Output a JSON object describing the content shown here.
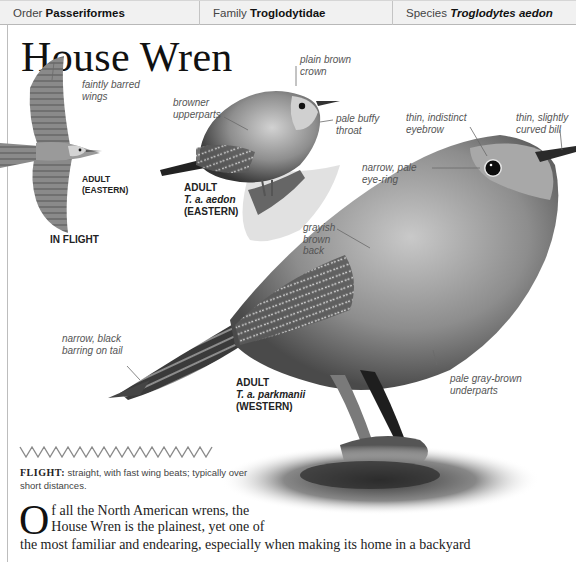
{
  "taxonomy": {
    "order_label": "Order",
    "order_value": "Passeriformes",
    "family_label": "Family",
    "family_value": "Troglodytidae",
    "species_label": "Species",
    "species_value": "Troglodytes aedon"
  },
  "title": "House Wren",
  "flight_illustration": {
    "annotation": [
      "faintly barred",
      "wings"
    ],
    "caption_line1": "ADULT",
    "caption_line2": "(EASTERN)",
    "label": "IN FLIGHT"
  },
  "eastern_bird": {
    "annotations": {
      "crown": [
        "plain brown",
        "crown"
      ],
      "upperparts": [
        "browner",
        "upperparts"
      ],
      "throat": [
        "pale buffy",
        "throat"
      ]
    },
    "caption_line1": "ADULT",
    "caption_line2": "T. a. aedon",
    "caption_line3": "(EASTERN)"
  },
  "western_bird": {
    "annotations": {
      "eyebrow": [
        "thin, indistinct",
        "eyebrow"
      ],
      "bill": [
        "thin, slightly",
        "curved bill"
      ],
      "eye_ring": [
        "narrow, pale",
        "eye-ring"
      ],
      "back": [
        "grayish",
        "brown",
        "back"
      ],
      "tail": [
        "narrow, black",
        "barring on tail"
      ],
      "underparts": [
        "pale gray-brown",
        "underparts"
      ]
    },
    "caption_line1": "ADULT",
    "caption_line2": "T. a. parkmanii",
    "caption_line3": "(WESTERN)"
  },
  "flight": {
    "label": "FLIGHT:",
    "text": " straight, with fast wing beats; typically over short distances."
  },
  "body": {
    "dropcap": "O",
    "line1": "f all the North American wrens, the",
    "line2": "House Wren is the plainest, yet one of",
    "line3": "the most familiar and endearing, especially when making its home in a backyard"
  },
  "colors": {
    "header_bg": "#f1f1f1",
    "rule": "#bdbdbd",
    "flight_zigzag": "#8a8a8a"
  }
}
